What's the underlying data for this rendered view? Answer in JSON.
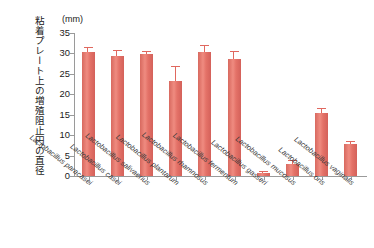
{
  "chart_data": {
    "type": "bar",
    "title": "",
    "subtitle": "",
    "unit_label": "(mm)",
    "ylabel": "粘着プレート上の増殖阻止円の直径",
    "xlabel": "",
    "ylim": [
      0,
      35
    ],
    "yticks": [
      0,
      5,
      10,
      15,
      20,
      25,
      30,
      35
    ],
    "ytick_labels": [
      "0",
      "5",
      "10",
      "15",
      "20",
      "25",
      "30",
      "35"
    ],
    "grid": false,
    "legend": false,
    "bar_color": "#e0685f",
    "axis_color": "#9a9a9a",
    "categories": [
      "Lactobacillus paracasei",
      "Lactobacillus casei",
      "Lactobacillus salivaerius",
      "Lactobacillus plantarum",
      "Lactobacillus rhamnosus",
      "Lactobacillus fermentum",
      "Lactobacillus gasseri",
      "Lactobacillus mucosus",
      "Lactobacillus oris",
      "Lactobacillus vaginalis"
    ],
    "values": [
      30.3,
      29.4,
      29.8,
      23.2,
      30.3,
      28.7,
      0.7,
      3.0,
      15.5,
      7.8
    ],
    "errors": [
      1.1,
      1.2,
      0.5,
      3.6,
      1.6,
      1.7,
      0.2,
      0.6,
      0.8,
      0.6
    ]
  }
}
